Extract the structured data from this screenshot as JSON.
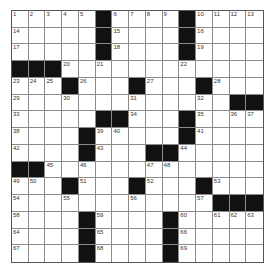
{
  "puzzle": {
    "size": 15,
    "colors": {
      "block": "#111111",
      "cell": "#ffffff",
      "gridline": "#8a8a8a"
    },
    "rows": [
      [
        "1",
        "2",
        "3",
        "4",
        "5",
        "#",
        "6",
        "7",
        "8",
        "9",
        "#",
        "10",
        "11",
        "12",
        "13"
      ],
      [
        "14",
        "",
        "",
        "",
        "",
        "#",
        "15",
        "",
        "",
        "",
        "#",
        "16",
        "",
        "",
        ""
      ],
      [
        "17",
        "",
        "",
        "",
        "",
        "#",
        "18",
        "",
        "",
        "",
        "#",
        "19",
        "",
        "",
        ""
      ],
      [
        "#",
        "#",
        "#",
        "20",
        "",
        "21",
        "",
        "",
        "",
        "",
        "22",
        "",
        "",
        "",
        ""
      ],
      [
        "23",
        "24",
        "25",
        "#",
        "26",
        "",
        "",
        "#",
        "27",
        "",
        "",
        "#",
        "28",
        "",
        ""
      ],
      [
        "29",
        "",
        "",
        "30",
        "",
        "",
        "",
        "31",
        "",
        "",
        "",
        "32",
        "",
        "#",
        "#"
      ],
      [
        "33",
        "",
        "",
        "",
        "",
        "#",
        "#",
        "34",
        "",
        "",
        "#",
        "35",
        "",
        "36",
        "37"
      ],
      [
        "38",
        "",
        "",
        "",
        "#",
        "39",
        "40",
        "",
        "",
        "",
        "#",
        "41",
        "",
        "",
        ""
      ],
      [
        "42",
        "",
        "",
        "",
        "#",
        "43",
        "",
        "",
        "#",
        "#",
        "44",
        "",
        "",
        "",
        ""
      ],
      [
        "#",
        "#",
        "45",
        "",
        "46",
        "",
        "",
        "",
        "47",
        "48",
        "",
        "",
        "",
        "",
        ""
      ],
      [
        "49",
        "50",
        "",
        "#",
        "51",
        "",
        "",
        "#",
        "52",
        "",
        "",
        "#",
        "53",
        "",
        ""
      ],
      [
        "54",
        "",
        "",
        "55",
        "",
        "",
        "",
        "56",
        "",
        "",
        "",
        "57",
        "#",
        "#",
        "#"
      ],
      [
        "58",
        "",
        "",
        "",
        "#",
        "59",
        "",
        "",
        "",
        "#",
        "60",
        "",
        "61",
        "62",
        "63"
      ],
      [
        "64",
        "",
        "",
        "",
        "#",
        "65",
        "",
        "",
        "",
        "#",
        "66",
        "",
        "",
        "",
        ""
      ],
      [
        "67",
        "",
        "",
        "",
        "#",
        "68",
        "",
        "",
        "",
        "#",
        "69",
        "",
        "",
        "",
        ""
      ]
    ]
  }
}
